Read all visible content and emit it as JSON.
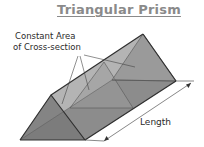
{
  "title": "Triangular Prism",
  "labels": {
    "cross_section_line1": "Constant Area",
    "cross_section_line2": "of Cross-section",
    "length": "Length"
  },
  "colors": {
    "title": "#8a8a8a",
    "text": "#2a2a2a",
    "edge": "#333333",
    "face_dark": "#6e6e6e",
    "face_mid": "#8c8c8c",
    "face_light": "#b4b4b4",
    "cross_section": "#9a9a9a"
  }
}
